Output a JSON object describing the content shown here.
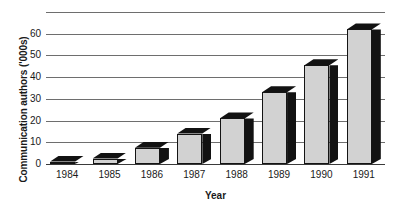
{
  "chart_data": {
    "type": "bar",
    "title": "",
    "xlabel": "Year",
    "ylabel": "Communication authors ('000s)",
    "categories": [
      "1984",
      "1985",
      "1986",
      "1987",
      "1988",
      "1989",
      "1990",
      "1991"
    ],
    "values": [
      1,
      2.5,
      7.5,
      14,
      21,
      33,
      45.5,
      62
    ],
    "ylim": [
      0,
      70
    ],
    "yticks": [
      0,
      10,
      20,
      30,
      40,
      50,
      60
    ],
    "ytick_labels": [
      "0",
      "10",
      "20",
      "30",
      "40",
      "50",
      "60"
    ],
    "gridlines": [
      0,
      10,
      20,
      30,
      40,
      50,
      60,
      70
    ],
    "grid": true,
    "legend": null,
    "series_name": "Communication authors",
    "bar_style": "3d-shadow",
    "colors": {
      "bar_face": "#d2d2d2",
      "bar_side": "#121212",
      "bar_outline": "#141414",
      "gridline": "#6e6e6e",
      "axis": "#3a3a3a",
      "text": "#1a1a1a",
      "background": "#ffffff"
    }
  }
}
